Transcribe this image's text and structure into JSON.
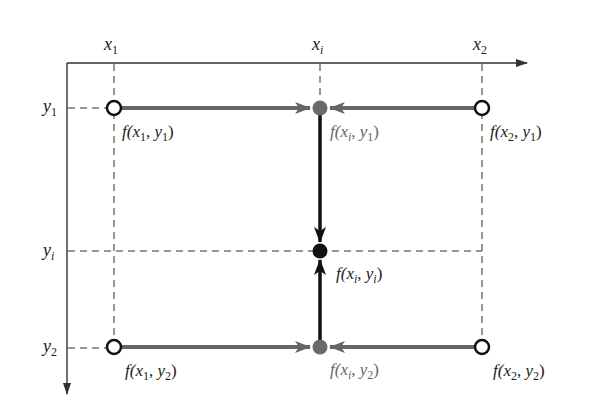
{
  "diagram": {
    "type": "bilinear-interpolation",
    "axes": {
      "x_ticks": [
        {
          "id": "x1",
          "base": "x",
          "sub": "1"
        },
        {
          "id": "xi",
          "base": "x",
          "sub": "i"
        },
        {
          "id": "x2",
          "base": "x",
          "sub": "2"
        }
      ],
      "y_ticks": [
        {
          "id": "y1",
          "base": "y",
          "sub": "1"
        },
        {
          "id": "yi",
          "base": "y",
          "sub": "i"
        },
        {
          "id": "y2",
          "base": "y",
          "sub": "2"
        }
      ]
    },
    "points": [
      {
        "id": "f_x1_y1",
        "style": "open-circle",
        "label": {
          "f": "f(",
          "a": "x",
          "as": "1",
          "sep": ", ",
          "b": "y",
          "bs": "1",
          "close": ")"
        }
      },
      {
        "id": "f_xi_y1",
        "style": "grey-filled",
        "label": {
          "f": "f(",
          "a": "x",
          "as": "i",
          "sep": ", ",
          "b": "y",
          "bs": "1",
          "close": ")"
        }
      },
      {
        "id": "f_x2_y1",
        "style": "open-circle",
        "label": {
          "f": "f(",
          "a": "x",
          "as": "2",
          "sep": ", ",
          "b": "y",
          "bs": "1",
          "close": ")"
        }
      },
      {
        "id": "f_xi_yi",
        "style": "black-filled",
        "label": {
          "f": "f(",
          "a": "x",
          "as": "i",
          "sep": ", ",
          "b": "y",
          "bs": "i",
          "close": ")"
        }
      },
      {
        "id": "f_x1_y2",
        "style": "open-circle",
        "label": {
          "f": "f(",
          "a": "x",
          "as": "1",
          "sep": ", ",
          "b": "y",
          "bs": "2",
          "close": ")"
        }
      },
      {
        "id": "f_xi_y2",
        "style": "grey-filled",
        "label": {
          "f": "f(",
          "a": "x",
          "as": "i",
          "sep": ", ",
          "b": "y",
          "bs": "2",
          "close": ")"
        }
      },
      {
        "id": "f_x2_y2",
        "style": "open-circle",
        "label": {
          "f": "f(",
          "a": "x",
          "as": "2",
          "sep": ", ",
          "b": "y",
          "bs": "2",
          "close": ")"
        }
      }
    ],
    "colors": {
      "axis": "#333333",
      "grey_arrow": "#666666",
      "black_arrow": "#111111",
      "grey_point": "#6a6a6a",
      "black_point": "#111111",
      "grey_label": "#666666"
    }
  }
}
